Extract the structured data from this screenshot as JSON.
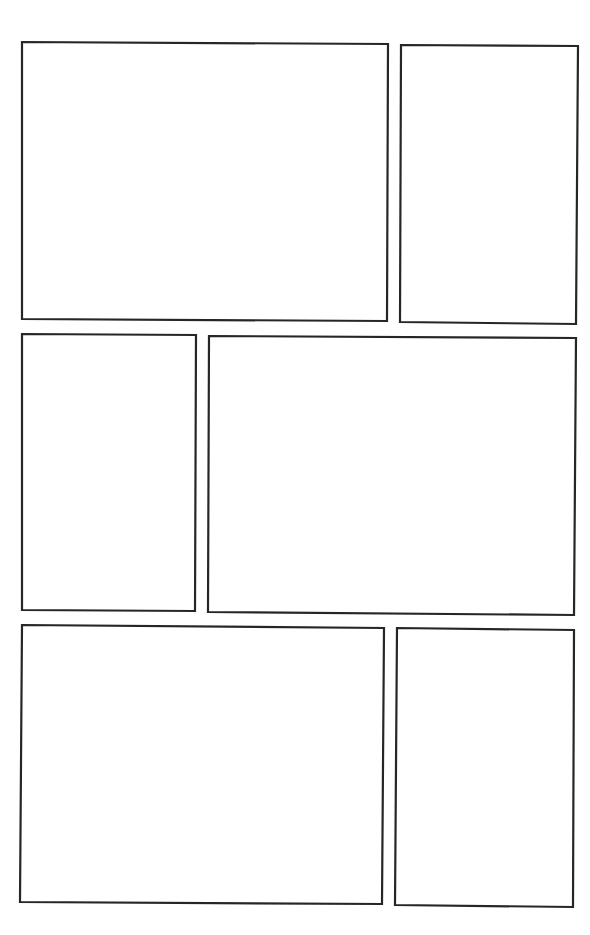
{
  "page": {
    "width": 590,
    "height": 935,
    "background": "#ffffff",
    "border_color": "#262626",
    "border_width": 2.2
  },
  "panels": [
    {
      "id": "panel-1",
      "row": 1,
      "col": 1,
      "points": "22,42 388,44 387,321 22,319",
      "content": ""
    },
    {
      "id": "panel-2",
      "row": 1,
      "col": 2,
      "points": "401,45 578,46 576,324 400,322",
      "content": ""
    },
    {
      "id": "panel-3",
      "row": 2,
      "col": 1,
      "points": "22,334 196,335 195,611 22,610",
      "content": ""
    },
    {
      "id": "panel-4",
      "row": 2,
      "col": 2,
      "points": "209,336 576,338 574,615 208,612",
      "content": ""
    },
    {
      "id": "panel-5",
      "row": 3,
      "col": 1,
      "points": "22,625 384,628 382,904 20,902",
      "content": ""
    },
    {
      "id": "panel-6",
      "row": 3,
      "col": 2,
      "points": "397,628 574,630 573,907 395,905",
      "content": ""
    }
  ]
}
